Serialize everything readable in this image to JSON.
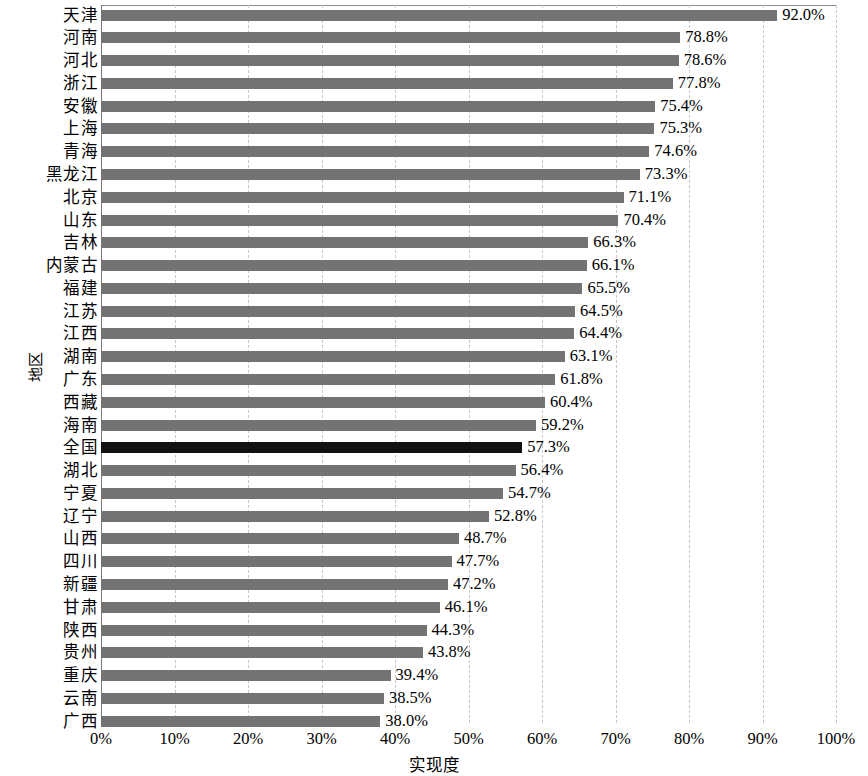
{
  "chart_data": {
    "type": "bar",
    "orientation": "horizontal",
    "title": "",
    "xlabel": "实现度",
    "ylabel": "地区",
    "xlim": [
      0,
      100
    ],
    "xticks": [
      "0%",
      "10%",
      "20%",
      "30%",
      "40%",
      "50%",
      "60%",
      "70%",
      "80%",
      "90%",
      "100%"
    ],
    "xtick_values": [
      0,
      10,
      20,
      30,
      40,
      50,
      60,
      70,
      80,
      90,
      100
    ],
    "grid": "vertical-dashed",
    "legend": "none",
    "value_label_suffix": "%",
    "bar_color": "#737373",
    "highlight_color": "#111111",
    "highlight_category": "全国",
    "categories": [
      "天津",
      "河南",
      "河北",
      "浙江",
      "安徽",
      "上海",
      "青海",
      "黑龙江",
      "北京",
      "山东",
      "吉林",
      "内蒙古",
      "福建",
      "江苏",
      "江西",
      "湖南",
      "广东",
      "西藏",
      "海南",
      "全国",
      "湖北",
      "宁夏",
      "辽宁",
      "山西",
      "四川",
      "新疆",
      "甘肃",
      "陕西",
      "贵州",
      "重庆",
      "云南",
      "广西"
    ],
    "values": [
      92.0,
      78.8,
      78.6,
      77.8,
      75.4,
      75.3,
      74.6,
      73.3,
      71.1,
      70.4,
      66.3,
      66.1,
      65.5,
      64.5,
      64.4,
      63.1,
      61.8,
      60.4,
      59.2,
      57.3,
      56.4,
      54.7,
      52.8,
      48.7,
      47.7,
      47.2,
      46.1,
      44.3,
      43.8,
      39.4,
      38.5,
      38.0
    ],
    "value_labels": [
      "92.0%",
      "78.8%",
      "78.6%",
      "77.8%",
      "75.4%",
      "75.3%",
      "74.6%",
      "73.3%",
      "71.1%",
      "70.4%",
      "66.3%",
      "66.1%",
      "65.5%",
      "64.5%",
      "64.4%",
      "63.1%",
      "61.8%",
      "60.4%",
      "59.2%",
      "57.3%",
      "56.4%",
      "54.7%",
      "52.8%",
      "48.7%",
      "47.7%",
      "47.2%",
      "46.1%",
      "44.3%",
      "43.8%",
      "39.4%",
      "38.5%",
      "38.0%"
    ]
  }
}
